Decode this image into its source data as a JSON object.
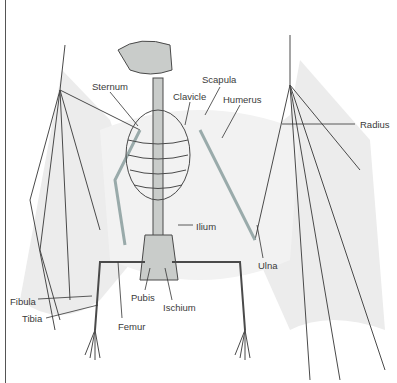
{
  "diagram": {
    "labels": [
      {
        "key": "sternum",
        "text": "Sternum",
        "x": 92,
        "y": 82
      },
      {
        "key": "scapula",
        "text": "Scapula",
        "x": 202,
        "y": 75
      },
      {
        "key": "clavicle",
        "text": "Clavicle",
        "x": 173,
        "y": 92
      },
      {
        "key": "humerus",
        "text": "Humerus",
        "x": 223,
        "y": 95
      },
      {
        "key": "radius",
        "text": "Radius",
        "x": 360,
        "y": 120
      },
      {
        "key": "ilium",
        "text": "Ilium",
        "x": 196,
        "y": 222
      },
      {
        "key": "ulna",
        "text": "Ulna",
        "x": 258,
        "y": 261
      },
      {
        "key": "fibula",
        "text": "Fibula",
        "x": 10,
        "y": 297
      },
      {
        "key": "tibia",
        "text": "Tibia",
        "x": 22,
        "y": 314
      },
      {
        "key": "pubis",
        "text": "Pubis",
        "x": 131,
        "y": 293
      },
      {
        "key": "ischium",
        "text": "Ischium",
        "x": 163,
        "y": 303
      },
      {
        "key": "femur",
        "text": "Femur",
        "x": 118,
        "y": 322
      }
    ],
    "colors": {
      "bone": "#c9ccca",
      "bone_outline": "#4a4a4a",
      "membrane": "#ececec",
      "leader_line": "#333333",
      "label_text": "#3a3a3a"
    }
  }
}
